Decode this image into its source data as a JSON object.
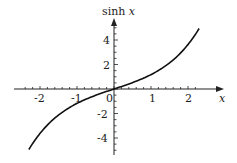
{
  "chart_data": {
    "type": "line",
    "title": "",
    "xlabel": "x",
    "ylabel": "sinh x",
    "xlim": [
      -2.35,
      2.35
    ],
    "ylim": [
      -5,
      5
    ],
    "x_ticks": [
      -2,
      -1,
      0,
      1,
      2
    ],
    "y_ticks": [
      -4,
      -2,
      2,
      4
    ],
    "grid": false,
    "series": [
      {
        "name": "sinh x",
        "function": "sinh(x)",
        "x": [
          -2.3,
          -2.0,
          -1.5,
          -1.0,
          -0.5,
          0,
          0.5,
          1.0,
          1.5,
          2.0,
          2.3
        ],
        "y": [
          -4.94,
          -3.63,
          -2.13,
          -1.18,
          -0.52,
          0,
          0.52,
          1.18,
          2.13,
          3.63,
          4.94
        ]
      }
    ]
  },
  "labels": {
    "ylabel_main": "sinh",
    "ylabel_var": "x",
    "xlabel": "x",
    "xt_m2": "-2",
    "xt_m1": "-1",
    "xt_0": "0",
    "xt_1": "1",
    "xt_2": "2",
    "yt_4": "4",
    "yt_2": "2",
    "yt_m2": "-2",
    "yt_m4": "-4"
  }
}
